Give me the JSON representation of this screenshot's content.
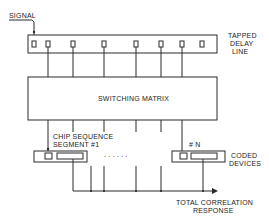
{
  "labels": {
    "signal": "SIGNAL",
    "tapped_delay_line_1": "TAPPED",
    "tapped_delay_line_2": "DELAY",
    "tapped_delay_line_3": "LINE",
    "switching_matrix": "SWITCHING MATRIX",
    "chip_sequence_1": "CHIP SEQUENCE",
    "chip_sequence_2": "SEGMENT #1",
    "dots": ". . . . . .",
    "segment_n": "# N",
    "coded_devices_1": "CODED",
    "coded_devices_2": "DEVICES",
    "total_correlation_1": "TOTAL CORRELATION",
    "total_correlation_2": "RESPONSE"
  },
  "colors": {
    "line": "#2a2a2a",
    "background": "#ffffff"
  }
}
